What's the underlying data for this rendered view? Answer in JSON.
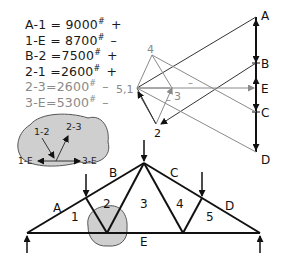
{
  "forces": [
    {
      "member": "A-1",
      "value": "9000",
      "unit": "#",
      "sign": "+",
      "tone": "dark"
    },
    {
      "member": "1-E",
      "value": "8700",
      "unit": "#",
      "sign": "–",
      "tone": "dark"
    },
    {
      "member": "B-2",
      "value": "7500",
      "unit": "#",
      "sign": "+",
      "tone": "dark"
    },
    {
      "member": "2-1",
      "value": "2600",
      "unit": "#",
      "sign": "+",
      "tone": "dark"
    },
    {
      "member": "2-3",
      "value": "2600",
      "unit": "#",
      "sign": "–",
      "tone": "light"
    },
    {
      "member": "3-E",
      "value": "5300",
      "unit": "#",
      "sign": "–",
      "tone": "light"
    }
  ],
  "force_polygon": {
    "load_line_labels": [
      "A",
      "B",
      "E",
      "C",
      "D"
    ],
    "node_labels": {
      "n4": "4",
      "n51": "5,1",
      "n3": "3",
      "n2": "2"
    },
    "minus_marks": [
      "–",
      "–"
    ]
  },
  "joint_detail": {
    "labels": {
      "top_left": "1-2",
      "top_right": "2-3",
      "left": "1-E",
      "right": "3-E"
    }
  },
  "truss": {
    "space_labels": {
      "A": "A",
      "B": "B",
      "C": "C",
      "D": "D",
      "E": "E"
    },
    "panel_labels": [
      "1",
      "2",
      "3",
      "4",
      "5"
    ]
  },
  "colors": {
    "ink": "#111111",
    "light_ink": "#8a8a8a",
    "blob_fill": "#cfcfcf",
    "blob_stroke": "#555555"
  }
}
